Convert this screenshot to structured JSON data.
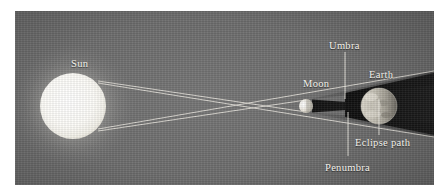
{
  "figure": {
    "type": "solar-eclipse-geometry-diagram",
    "background_color": "#6d6d6d",
    "label_color": "#f2f0ea",
    "frame": {
      "left": 15,
      "top": 11,
      "width": 419,
      "height": 174
    }
  },
  "labels": {
    "sun": "Sun",
    "moon": "Moon",
    "earth": "Earth",
    "umbra": "Umbra",
    "penumbra": "Penumbra",
    "eclipse_path": "Eclipse path"
  },
  "bodies": [
    {
      "name": "sun",
      "label": "Sun",
      "cx": 58,
      "cy": 95,
      "r": 33,
      "color": "#ffffff",
      "glow": true
    },
    {
      "name": "moon",
      "label": "Moon",
      "cx": 291,
      "cy": 95,
      "r": 7,
      "color": "#efece4",
      "glow": false
    },
    {
      "name": "earth",
      "label": "Earth",
      "cx": 364,
      "cy": 95,
      "r": 18,
      "color": "#bdb9ae",
      "glow": false
    }
  ],
  "shadows": [
    {
      "name": "umbra",
      "label": "Umbra",
      "description": "dark cone from Moon converging toward Earth"
    },
    {
      "name": "penumbra",
      "label": "Penumbra",
      "description": "lighter outer shadow cone spreading past Earth"
    },
    {
      "name": "earth-night-side",
      "label": "",
      "description": "dark wedge behind Earth to right edge"
    }
  ],
  "rays": {
    "count": 4,
    "color": "#ece9e1",
    "description": "tangent light rays from Sun limbs crossing past the Moon"
  },
  "leader_lines": [
    {
      "for": "umbra",
      "orientation": "vertical",
      "from": "label",
      "to": "umbra-cone"
    },
    {
      "for": "penumbra",
      "orientation": "vertical",
      "from": "label",
      "to": "penumbra-region"
    },
    {
      "for": "eclipse-path",
      "orientation": "vertical",
      "from": "label",
      "to": "earth-surface"
    }
  ],
  "label_positions": {
    "sun": {
      "left": 56,
      "top": 47
    },
    "moon": {
      "left": 288,
      "top": 67
    },
    "earth": {
      "left": 354,
      "top": 58
    },
    "umbra": {
      "left": 327,
      "top": 29
    },
    "penumbra": {
      "left": 322,
      "top": 151
    },
    "eclipse_path": {
      "left": 352,
      "top": 126
    }
  }
}
